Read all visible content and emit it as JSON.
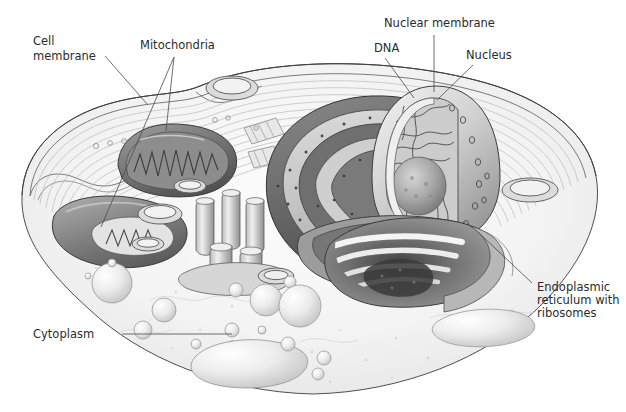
{
  "figure": {
    "background_color": "#ffffff",
    "ink_color": "#2b2b2b",
    "leader_color": "#4a4a4a",
    "style": "grayscale stippled scientific illustration"
  },
  "labels": [
    {
      "id": "cell-membrane",
      "lines": [
        "Cell",
        "membrane"
      ],
      "x": 33,
      "y": 45,
      "anchor": "start",
      "leader": [
        [
          105,
          56
        ],
        [
          148,
          105
        ]
      ]
    },
    {
      "id": "mitochondria",
      "lines": [
        "Mitochondria"
      ],
      "x": 140,
      "y": 49,
      "anchor": "start",
      "leader": [
        [
          174,
          57
        ],
        [
          166,
          131
        ]
      ],
      "leader2": [
        [
          174,
          57
        ],
        [
          101,
          227
        ]
      ]
    },
    {
      "id": "nuclear-membrane",
      "lines": [
        "Nuclear membrane"
      ],
      "x": 384,
      "y": 27,
      "anchor": "start",
      "leader": [
        [
          434,
          35
        ],
        [
          434,
          92
        ]
      ]
    },
    {
      "id": "dna",
      "lines": [
        "DNA"
      ],
      "x": 374,
      "y": 52,
      "anchor": "start",
      "leader": [
        [
          385,
          58
        ],
        [
          414,
          98
        ]
      ]
    },
    {
      "id": "nucleus",
      "lines": [
        "Nucleus"
      ],
      "x": 466,
      "y": 59,
      "anchor": "start",
      "leader": [
        [
          473,
          65
        ],
        [
          437,
          100
        ]
      ]
    },
    {
      "id": "endoplasmic-reticulum",
      "lines": [
        "Endoplasmic",
        "reticulum with",
        "ribosomes"
      ],
      "x": 537,
      "y": 291,
      "anchor": "start",
      "leader": [
        [
          532,
          283
        ],
        [
          478,
          232
        ]
      ]
    },
    {
      "id": "cytoplasm",
      "lines": [
        "Cytoplasm"
      ],
      "x": 33,
      "y": 338,
      "anchor": "start",
      "leader": [
        [
          122,
          334
        ],
        [
          232,
          334
        ]
      ]
    }
  ],
  "organelles": [
    {
      "name": "cell-membrane",
      "kind": "boundary"
    },
    {
      "name": "mitochondrion-upper",
      "kind": "mitochondrion"
    },
    {
      "name": "mitochondrion-lower",
      "kind": "mitochondrion"
    },
    {
      "name": "nucleus",
      "kind": "nucleus"
    },
    {
      "name": "nucleolus",
      "kind": "nucleolus"
    },
    {
      "name": "nuclear-membrane",
      "kind": "membrane"
    },
    {
      "name": "dna-chromatin",
      "kind": "chromatin"
    },
    {
      "name": "rough-endoplasmic-reticulum",
      "kind": "rough-er"
    },
    {
      "name": "golgi-apparatus",
      "kind": "golgi"
    },
    {
      "name": "vesicles",
      "kind": "vesicle-cluster"
    },
    {
      "name": "cytoplasm",
      "kind": "fluid"
    }
  ]
}
